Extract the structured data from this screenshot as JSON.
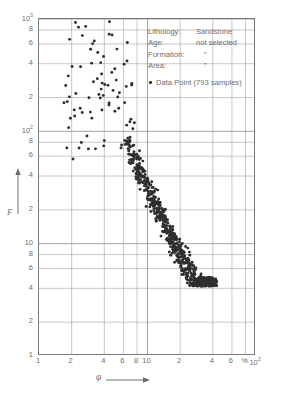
{
  "chart_data": {
    "type": "scatter",
    "title": "",
    "xlabel": "φ",
    "ylabel": "F",
    "xunit": "%",
    "xscale": "log",
    "yscale": "log",
    "xlim": [
      1,
      100
    ],
    "ylim": [
      1,
      1000
    ],
    "grid": true,
    "legend_position": "top-right-inside",
    "x_tick_labels": [
      "1",
      "2",
      "4",
      "6",
      "8",
      "10",
      "2",
      "4",
      "6",
      "%",
      "10"
    ],
    "x_tick_values": [
      1,
      2,
      4,
      6,
      8,
      10,
      20,
      40,
      60,
      80,
      100
    ],
    "x_decade_exponent": "2",
    "y_tick_labels": [
      "10",
      "8",
      "6",
      "4",
      "2",
      "10",
      "8",
      "6",
      "4",
      "2",
      "10",
      "8",
      "6",
      "4",
      "2",
      "1"
    ],
    "y_tick_values": [
      1000,
      800,
      600,
      400,
      200,
      100,
      80,
      60,
      40,
      20,
      10,
      8,
      6,
      4,
      2,
      1
    ],
    "y_decade_exponents": [
      "3",
      "2",
      "",
      ""
    ],
    "series": [
      {
        "name": "Data Point",
        "sample_count": 793,
        "marker": "filled-circle",
        "color": "#2f2f2f",
        "description": "Formation factor F versus porosity φ for sandstone; strong inverse power-law trend (Archie relation) with a dense band from φ≈8-40% and F≈100 down to F≈5, plus sparse outliers at low porosity and high formation factor."
      }
    ]
  },
  "annotations": {
    "rows": [
      {
        "key": "Lithology:",
        "value": "Sandstone"
      },
      {
        "key": "Age:",
        "value": "not selected"
      },
      {
        "key": "Formation:",
        "value": "”"
      },
      {
        "key": "Area:",
        "value": "”"
      }
    ],
    "series_label": "Data Point (793 samples)"
  },
  "caption": {
    "text": ""
  },
  "colors": {
    "marker": "#2f2f2f",
    "grid": "#9b9b9b",
    "frame": "#7b7b7b",
    "text": "#6e6e6e",
    "background": "#ffffff"
  }
}
